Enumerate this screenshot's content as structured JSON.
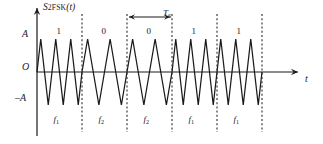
{
  "figure": {
    "title_signal": "S",
    "title_signal_sub": "2FSK",
    "title_signal_arg": "(t)",
    "y_axis_labels": {
      "pos": "A",
      "zero": "O",
      "neg": "–A"
    },
    "x_axis_label": "t",
    "period_marker": {
      "symbol": "T",
      "subscript": "S"
    }
  },
  "segments": [
    {
      "bit": "1",
      "freq": "f",
      "freq_sub": "1",
      "cycles": 3
    },
    {
      "bit": "0",
      "freq": "f",
      "freq_sub": "2",
      "cycles": 2
    },
    {
      "bit": "0",
      "freq": "f",
      "freq_sub": "2",
      "cycles": 2
    },
    {
      "bit": "1",
      "freq": "f",
      "freq_sub": "1",
      "cycles": 3
    },
    {
      "bit": "1",
      "freq": "f",
      "freq_sub": "1",
      "cycles": 3
    }
  ],
  "colors": {
    "stroke": "#1a1a1a",
    "dash": "#2b2b2b",
    "bg": "#ffffff"
  },
  "chart_data": {
    "type": "line",
    "xlabel": "t",
    "ylabel": "S_2FSK(t)",
    "ylim": [
      -1,
      1
    ],
    "ytick_labels": [
      "A",
      "O",
      "-A"
    ],
    "ytick_values": [
      1,
      0,
      -1
    ],
    "bit_sequence": [
      "1",
      "0",
      "0",
      "1",
      "1"
    ],
    "frequency_sequence": [
      "f1",
      "f2",
      "f2",
      "f1",
      "f1"
    ],
    "cycles_per_symbol": [
      3,
      2,
      2,
      3,
      3
    ],
    "symbol_boundaries_x": [
      37,
      82,
      127,
      172,
      217,
      262
    ],
    "symbol_duration_label": "TS",
    "grid": false,
    "legend": null,
    "annotations": [
      "TS double-headed arrow spans the third symbol interval"
    ]
  }
}
